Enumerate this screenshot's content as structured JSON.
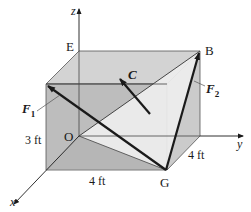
{
  "figure": {
    "points": {
      "E": "E",
      "B": "B",
      "O": "O",
      "G": "G"
    },
    "axes": {
      "x": "x",
      "y": "y",
      "z": "z"
    },
    "vectors": {
      "F1": {
        "symbol": "F",
        "sub": "1"
      },
      "F2": {
        "symbol": "F",
        "sub": "2"
      },
      "C": {
        "symbol": "C"
      }
    },
    "dimensions": {
      "height": "3 ft",
      "width_x": "4 ft",
      "depth_y": "4 ft"
    },
    "colors": {
      "box_top": "#d3d3d3",
      "box_front": "#bdbdbd",
      "box_side": "#c9c9c9",
      "plane": "#ececec",
      "line": "#1a1a1a"
    }
  }
}
